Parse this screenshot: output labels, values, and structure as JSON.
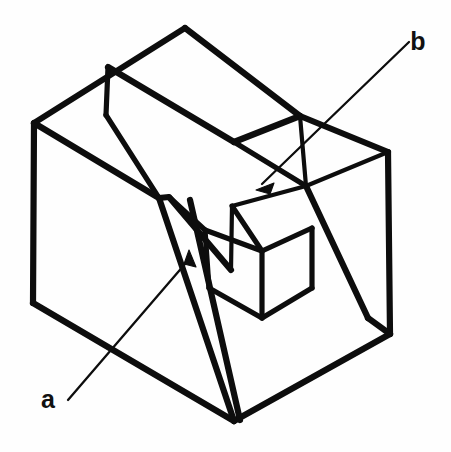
{
  "figure": {
    "kind": "isometric-line-drawing",
    "background_color": "#fefefe",
    "line_color": "#0d0d0d",
    "canvas": {
      "width": 451,
      "height": 452
    }
  },
  "callouts": [
    {
      "id": "a",
      "label": "a",
      "label_x": 48,
      "label_y": 408,
      "leader_start_x": 68,
      "leader_start_y": 400,
      "leader_end_x": 191,
      "leader_end_y": 257,
      "arrow_tip_x": 189,
      "arrow_tip_y": 252,
      "arrow_angle_deg": -50
    },
    {
      "id": "b",
      "label": "b",
      "label_x": 418,
      "label_y": 50,
      "leader_start_x": 409,
      "leader_start_y": 42,
      "leader_end_x": 262,
      "leader_end_y": 184,
      "arrow_tip_x": 258,
      "arrow_tip_y": 188,
      "arrow_angle_deg": 136
    }
  ],
  "geometry": {
    "outer_body": [
      {
        "name": "top-rear-left-ridge",
        "weight": "heavy",
        "points": "34,123 185,28"
      },
      {
        "name": "top-rear-right-ridge",
        "weight": "heavy",
        "points": "185,28 300,116"
      },
      {
        "name": "top-right-edge",
        "weight": "heavy",
        "points": "300,116 388,152"
      },
      {
        "name": "right-face-vertical",
        "weight": "heavy",
        "points": "388,152 390,334"
      },
      {
        "name": "bottom-right-edge",
        "weight": "heavy",
        "points": "390,334 234,421"
      },
      {
        "name": "bottom-left-edge",
        "weight": "heavy",
        "points": "234,421 33,303"
      },
      {
        "name": "left-face-vertical",
        "weight": "heavy",
        "points": "33,303 34,123"
      }
    ],
    "top_surface": [
      {
        "name": "front-top-fold-left",
        "weight": "heavy",
        "points": "34,123 159,198"
      },
      {
        "name": "groove-top-ridge",
        "weight": "heavy",
        "points": "108,67 234,142"
      },
      {
        "name": "groove-near-wall",
        "weight": "medium",
        "points": "108,67 106,115"
      },
      {
        "name": "groove-near-wall-base",
        "weight": "medium",
        "points": "106,115 159,198"
      },
      {
        "name": "slot-left-upper-edge",
        "weight": "heavy",
        "points": "234,142 300,116"
      },
      {
        "name": "slot-inner-top-left",
        "weight": "medium",
        "points": "234,142 306,186"
      },
      {
        "name": "slot-inner-top-right",
        "weight": "light",
        "points": "306,186 388,152"
      },
      {
        "name": "slot-right-rim",
        "weight": "light",
        "points": "300,116 306,186"
      }
    ],
    "front_faces": [
      {
        "name": "front-left-slab-face",
        "weight": "heavy",
        "points": "159,198 169,197 231,270"
      },
      {
        "name": "front-left-slab-edge",
        "weight": "heavy",
        "points": "159,198 234,421"
      },
      {
        "name": "front-rib-right",
        "weight": "heavy",
        "points": "190,200 240,420"
      },
      {
        "name": "pocket-left-wall",
        "weight": "medium",
        "points": "169,197 205,230"
      },
      {
        "name": "pocket-front-lower",
        "weight": "medium",
        "points": "205,230 209,288"
      },
      {
        "name": "pocket-bottom-front",
        "weight": "medium",
        "points": "209,288 262,318"
      },
      {
        "name": "pocket-bottom-right",
        "weight": "medium",
        "points": "262,318 312,288"
      },
      {
        "name": "pocket-inner-vertical",
        "weight": "medium",
        "points": "262,251 262,318"
      },
      {
        "name": "pocket-inner-left-diag",
        "weight": "medium",
        "points": "205,230 262,251"
      },
      {
        "name": "pocket-inner-right-diag",
        "weight": "medium",
        "points": "262,251 312,228"
      },
      {
        "name": "pocket-right-wall",
        "weight": "medium",
        "points": "312,228 312,288"
      },
      {
        "name": "pocket-rear-upper",
        "weight": "medium",
        "points": "232,206 262,251"
      }
    ],
    "right_inner": [
      {
        "name": "right-slot-front-face",
        "weight": "heavy",
        "points": "306,186 368,318"
      },
      {
        "name": "right-slot-lower-fold",
        "weight": "heavy",
        "points": "368,318 390,334"
      },
      {
        "name": "right-slot-rear-edge",
        "weight": "light",
        "points": "232,206 306,186"
      },
      {
        "name": "right-rib-ridge",
        "weight": "light",
        "points": "232,206 231,270"
      }
    ]
  }
}
